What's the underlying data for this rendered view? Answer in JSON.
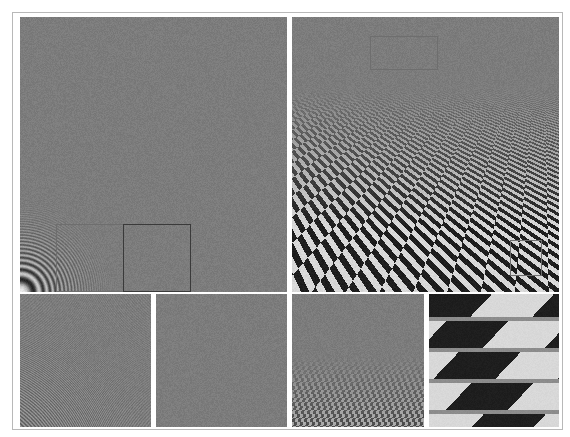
{
  "figure": {
    "colors": {
      "background": "#ffffff",
      "frame": "#b8b8b8",
      "gray_mid": "#7c7c7c",
      "checker_dark": "#1e1e1e",
      "checker_light": "#d8d8d8",
      "box_dark": "#3a3a3a",
      "box_faint": "#6e6e6e"
    },
    "panels": [
      {
        "id": "zone-plate-main",
        "pattern": "zone-plate",
        "x": 20,
        "y": 17,
        "w": 267,
        "h": 275,
        "boxes": [
          {
            "x": 56,
            "y": 224,
            "w": 68,
            "h": 68,
            "style": "faint"
          },
          {
            "x": 123,
            "y": 224,
            "w": 68,
            "h": 68,
            "style": "dark"
          }
        ]
      },
      {
        "id": "zone-plate-inset-left",
        "pattern": "zone-plate-zoom",
        "x": 20,
        "y": 294,
        "w": 131,
        "h": 133
      },
      {
        "id": "zone-plate-inset-right",
        "pattern": "flat-gray",
        "x": 156,
        "y": 294,
        "w": 131,
        "h": 133
      },
      {
        "id": "checkerboard-main",
        "pattern": "perspective-checker",
        "x": 292,
        "y": 17,
        "w": 267,
        "h": 275,
        "boxes": [
          {
            "x": 370,
            "y": 36,
            "w": 68,
            "h": 34,
            "style": "faint"
          },
          {
            "x": 510,
            "y": 240,
            "w": 32,
            "h": 36,
            "style": "faint"
          }
        ]
      },
      {
        "id": "checkerboard-inset-left",
        "pattern": "checker-far",
        "x": 292,
        "y": 294,
        "w": 132,
        "h": 133
      },
      {
        "id": "checkerboard-inset-right",
        "pattern": "checker-near-zoom",
        "x": 429,
        "y": 294,
        "w": 130,
        "h": 133
      }
    ]
  }
}
